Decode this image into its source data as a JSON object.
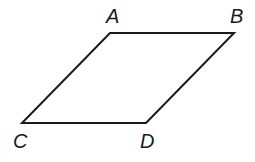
{
  "diagram": {
    "type": "parallelogram",
    "stroke_color": "#1a1a1a",
    "vertices": {
      "A": {
        "label": "A",
        "x": 110,
        "y": 33
      },
      "B": {
        "label": "B",
        "x": 234,
        "y": 33
      },
      "D": {
        "label": "D",
        "x": 146,
        "y": 123
      },
      "C": {
        "label": "C",
        "x": 22,
        "y": 123
      }
    },
    "labels": {
      "A": "A",
      "B": "B",
      "C": "C",
      "D": "D"
    }
  }
}
